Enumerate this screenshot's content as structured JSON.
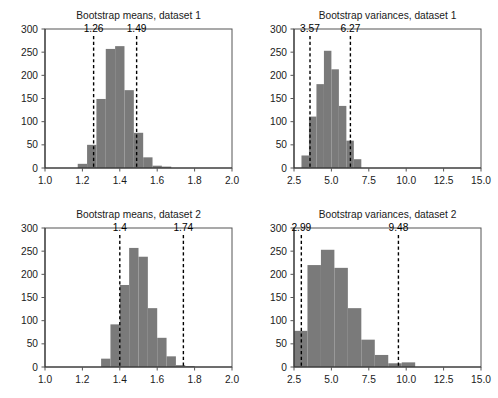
{
  "figure": {
    "background_color": "#ffffff",
    "bar_color": "#7a7a7a",
    "axis_color": "#333333",
    "cut_line_color": "#000000",
    "width": 498,
    "height": 398
  },
  "chart_data": [
    {
      "type": "bar",
      "id": "bootstrap-means-dataset-1",
      "title": "Bootstrap means, dataset 1",
      "xlabel": "",
      "ylabel": "",
      "xlim": [
        1.0,
        2.0
      ],
      "ylim": [
        0,
        300
      ],
      "grid": false,
      "legend": "none",
      "xticks": [
        1.0,
        1.2,
        1.4,
        1.6,
        1.8,
        2.0
      ],
      "xtick_labels": [
        "1.0",
        "1.2",
        "1.4",
        "1.6",
        "1.8",
        "2.0"
      ],
      "yticks": [
        0,
        50,
        100,
        150,
        200,
        250,
        300
      ],
      "ytick_labels": [
        "0",
        "50",
        "100",
        "150",
        "200",
        "250",
        "300"
      ],
      "bin_edges": [
        1.175,
        1.225,
        1.275,
        1.325,
        1.375,
        1.425,
        1.475,
        1.525,
        1.575,
        1.625,
        1.675
      ],
      "values": [
        9,
        50,
        149,
        257,
        263,
        168,
        76,
        23,
        5,
        3
      ],
      "annotations": [
        {
          "label": "1.26",
          "x": 1.26,
          "kind": "vertical-dashed-line"
        },
        {
          "label": "1.49",
          "x": 1.49,
          "kind": "vertical-dashed-line"
        }
      ]
    },
    {
      "type": "bar",
      "id": "bootstrap-variances-dataset-1",
      "title": "Bootstrap variances, dataset 1",
      "xlabel": "",
      "ylabel": "",
      "xlim": [
        2.5,
        15.0
      ],
      "ylim": [
        0,
        300
      ],
      "grid": false,
      "legend": "none",
      "xticks": [
        2.5,
        5.0,
        7.5,
        10.0,
        12.5,
        15.0
      ],
      "xtick_labels": [
        "2.5",
        "5.0",
        "7.5",
        "10.0",
        "12.5",
        "15.0"
      ],
      "yticks": [
        0,
        50,
        100,
        150,
        200,
        250,
        300
      ],
      "ytick_labels": [
        "0",
        "50",
        "100",
        "150",
        "200",
        "250",
        "300"
      ],
      "bin_edges": [
        3.0,
        3.5,
        4.0,
        4.5,
        5.0,
        5.5,
        6.0,
        6.5,
        7.0
      ],
      "values": [
        27,
        111,
        181,
        253,
        213,
        134,
        59,
        19
      ],
      "annotations": [
        {
          "label": "3.57",
          "x": 3.57,
          "kind": "vertical-dashed-line"
        },
        {
          "label": "6.27",
          "x": 6.27,
          "kind": "vertical-dashed-line"
        }
      ]
    },
    {
      "type": "bar",
      "id": "bootstrap-means-dataset-2",
      "title": "Bootstrap means, dataset 2",
      "xlabel": "",
      "ylabel": "",
      "xlim": [
        1.0,
        2.0
      ],
      "ylim": [
        0,
        300
      ],
      "grid": false,
      "legend": "none",
      "xticks": [
        1.0,
        1.2,
        1.4,
        1.6,
        1.8,
        2.0
      ],
      "xtick_labels": [
        "1.0",
        "1.2",
        "1.4",
        "1.6",
        "1.8",
        "2.0"
      ],
      "yticks": [
        0,
        50,
        100,
        150,
        200,
        250,
        300
      ],
      "ytick_labels": [
        "0",
        "50",
        "100",
        "150",
        "200",
        "250",
        "300"
      ],
      "bin_edges": [
        1.3,
        1.35,
        1.4,
        1.45,
        1.5,
        1.55,
        1.6,
        1.65,
        1.7,
        1.75,
        1.8,
        1.85,
        1.9,
        1.95
      ],
      "values": [
        18,
        92,
        177,
        257,
        238,
        127,
        63,
        23,
        4,
        2,
        0,
        0,
        0
      ],
      "annotations": [
        {
          "label": "1.4",
          "x": 1.4,
          "kind": "vertical-dashed-line"
        },
        {
          "label": "1.74",
          "x": 1.74,
          "kind": "vertical-dashed-line"
        }
      ]
    },
    {
      "type": "bar",
      "id": "bootstrap-variances-dataset-2",
      "title": "Bootstrap variances, dataset 2",
      "xlabel": "",
      "ylabel": "",
      "xlim": [
        2.5,
        15.0
      ],
      "ylim": [
        0,
        300
      ],
      "grid": false,
      "legend": "none",
      "xticks": [
        2.5,
        5.0,
        7.5,
        10.0,
        12.5,
        15.0
      ],
      "xtick_labels": [
        "2.5",
        "5.0",
        "7.5",
        "10.0",
        "12.5",
        "15.0"
      ],
      "yticks": [
        0,
        50,
        100,
        150,
        200,
        250,
        300
      ],
      "ytick_labels": [
        "0",
        "50",
        "100",
        "150",
        "200",
        "250",
        "300"
      ],
      "bin_edges": [
        2.5,
        3.4,
        4.3,
        5.2,
        6.1,
        7.0,
        7.9,
        8.8,
        9.7,
        10.6,
        11.5,
        12.4,
        13.3
      ],
      "values": [
        78,
        220,
        253,
        214,
        127,
        59,
        26,
        8,
        10,
        0,
        0,
        0
      ],
      "annotations": [
        {
          "label": "2.99",
          "x": 2.99,
          "kind": "vertical-dashed-line"
        },
        {
          "label": "9.48",
          "x": 9.48,
          "kind": "vertical-dashed-line"
        }
      ]
    }
  ]
}
